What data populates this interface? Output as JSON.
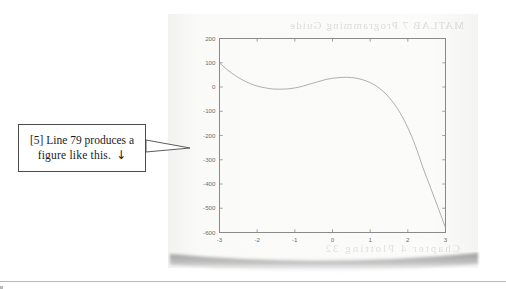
{
  "document": {
    "page_background_color": "#f7f7f6",
    "canvas_background_color": "#ffffff",
    "bleed_through_text_top": "MATLAB 7 Programming Guide",
    "bleed_through_text_bottom": "Chapter 4   Plotting   32"
  },
  "callout": {
    "line1": "[5] Line 79 produces a",
    "line2": "figure like this.",
    "arrow_glyph": "↓",
    "border_color": "#4a4a4a",
    "text_color": "#1b1b1b"
  },
  "chart_data": {
    "type": "line",
    "title": "",
    "xlabel": "",
    "ylabel": "",
    "xlim": [
      -3,
      3
    ],
    "ylim": [
      -600,
      200
    ],
    "xticks": [
      -3,
      -2,
      -1,
      0,
      1,
      2,
      3
    ],
    "xtick_labels": [
      "-3",
      "-2",
      "-1",
      "0",
      "1",
      "2",
      "3"
    ],
    "yticks": [
      200,
      100,
      0,
      -100,
      -200,
      -300,
      -400,
      -500,
      -600
    ],
    "ytick_labels": [
      "200",
      "100",
      "0",
      "-100",
      "-200",
      "-300",
      "-400",
      "-500",
      "-600"
    ],
    "grid": false,
    "box": true,
    "tick_direction": "in",
    "legend": null,
    "axis_color": "#8a8a8a",
    "tick_label_color": "#6e6e6e",
    "line_color": "#9a9a9a",
    "line_width": 0.8,
    "series": [
      {
        "name": "curve",
        "x": [
          -3.0,
          -2.8,
          -2.6,
          -2.4,
          -2.2,
          -2.0,
          -1.8,
          -1.6,
          -1.4,
          -1.2,
          -1.0,
          -0.8,
          -0.6,
          -0.4,
          -0.2,
          0.0,
          0.2,
          0.4,
          0.6,
          0.8,
          1.0,
          1.2,
          1.4,
          1.6,
          1.8,
          2.0,
          2.2,
          2.4,
          2.6,
          2.8,
          3.0
        ],
        "values": [
          100,
          72,
          49,
          30,
          15,
          4,
          -3,
          -8,
          -9,
          -8,
          -4,
          3,
          12,
          21,
          30,
          36,
          39,
          40,
          37,
          30,
          18,
          0,
          -26,
          -62,
          -108,
          -168,
          -242,
          -332,
          -414,
          -496,
          -580
        ]
      }
    ]
  }
}
